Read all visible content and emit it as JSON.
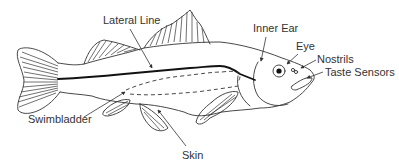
{
  "diagram": {
    "colors": {
      "line": "#333333",
      "background": "#ffffff"
    },
    "labels": {
      "lateral_line": "Lateral Line",
      "inner_ear": "Inner Ear",
      "eye": "Eye",
      "nostrils": "Nostrils",
      "taste_sensors": "Taste Sensors",
      "swimbladder": "Swimbladder",
      "skin": "Skin"
    }
  }
}
